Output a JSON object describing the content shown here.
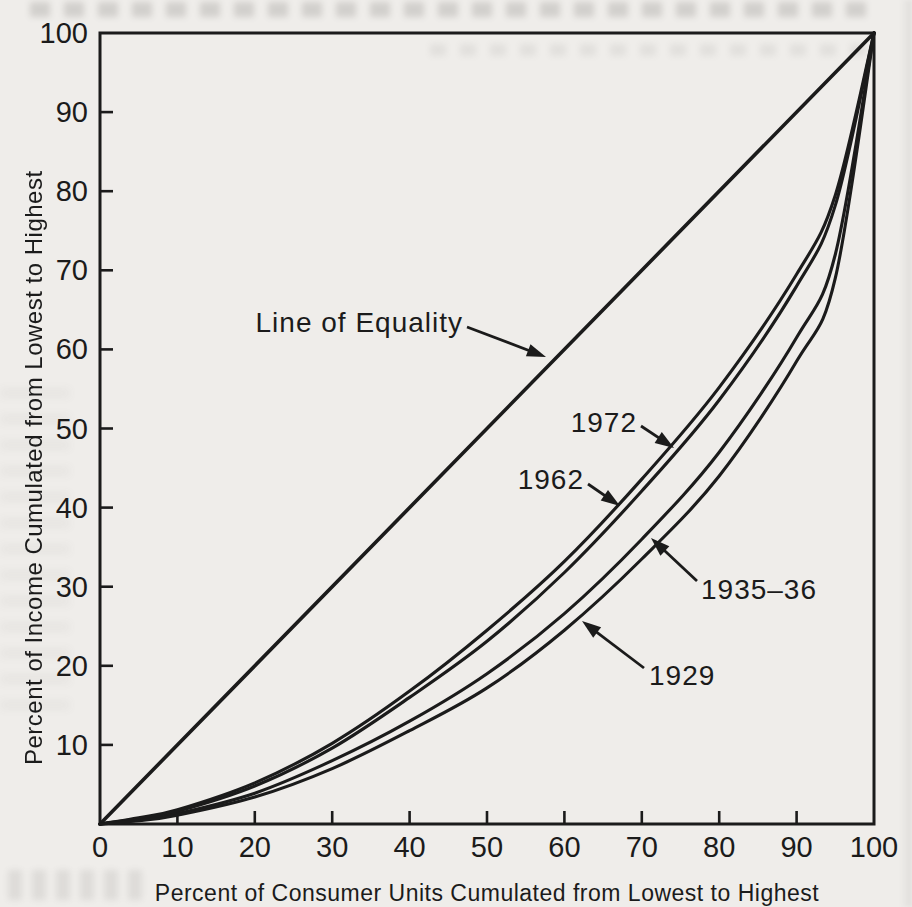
{
  "style": {
    "background": "#efedea",
    "ink": "#1b1b1b"
  },
  "chart_data": {
    "type": "line",
    "title": "",
    "xlabel": "Percent of Consumer Units Cumulated from Lowest to Highest",
    "ylabel": "Percent of Income Cumulated from Lowest to Highest",
    "xlim": [
      0,
      100
    ],
    "ylim": [
      0,
      100
    ],
    "x_ticks": [
      0,
      10,
      20,
      30,
      40,
      50,
      60,
      70,
      80,
      90,
      100
    ],
    "y_ticks": [
      10,
      20,
      30,
      40,
      50,
      60,
      70,
      80,
      90,
      100
    ],
    "grid": false,
    "legend": "arrow-annotated-labels",
    "series": [
      {
        "name": "Line of Equality",
        "points": [
          [
            0,
            0
          ],
          [
            100,
            100
          ]
        ]
      },
      {
        "name": "1972",
        "points": [
          [
            0,
            0
          ],
          [
            5,
            0.8
          ],
          [
            10,
            1.8
          ],
          [
            20,
            5.2
          ],
          [
            30,
            10.2
          ],
          [
            40,
            16.8
          ],
          [
            50,
            24.5
          ],
          [
            60,
            33.2
          ],
          [
            70,
            43.6
          ],
          [
            80,
            55.2
          ],
          [
            90,
            69.5
          ],
          [
            95,
            79.5
          ],
          [
            100,
            100
          ]
        ]
      },
      {
        "name": "1962",
        "points": [
          [
            0,
            0
          ],
          [
            5,
            0.7
          ],
          [
            10,
            1.6
          ],
          [
            20,
            4.8
          ],
          [
            30,
            9.6
          ],
          [
            40,
            16.0
          ],
          [
            50,
            23.1
          ],
          [
            60,
            31.8
          ],
          [
            70,
            42.1
          ],
          [
            80,
            53.6
          ],
          [
            90,
            68.0
          ],
          [
            95,
            78.2
          ],
          [
            100,
            100
          ]
        ]
      },
      {
        "name": "1935-36",
        "points": [
          [
            0,
            0
          ],
          [
            5,
            0.5
          ],
          [
            10,
            1.3
          ],
          [
            20,
            3.9
          ],
          [
            30,
            8.0
          ],
          [
            40,
            13.0
          ],
          [
            50,
            19.0
          ],
          [
            60,
            26.6
          ],
          [
            70,
            36.0
          ],
          [
            80,
            47.0
          ],
          [
            90,
            61.5
          ],
          [
            95,
            72.0
          ],
          [
            100,
            100
          ]
        ]
      },
      {
        "name": "1929",
        "points": [
          [
            0,
            0
          ],
          [
            5,
            0.4
          ],
          [
            10,
            1.1
          ],
          [
            20,
            3.4
          ],
          [
            30,
            7.0
          ],
          [
            40,
            11.8
          ],
          [
            50,
            17.2
          ],
          [
            60,
            24.5
          ],
          [
            70,
            33.5
          ],
          [
            80,
            44.0
          ],
          [
            90,
            58.5
          ],
          [
            95,
            69.0
          ],
          [
            100,
            100
          ]
        ]
      }
    ],
    "annotations": [
      {
        "text": "Line of Equality",
        "anchor": "end",
        "text_px": [
          463,
          322
        ],
        "arrow_from_px": [
          467,
          327
        ],
        "arrow_to_px": [
          546,
          357
        ]
      },
      {
        "text": "1972",
        "anchor": "end",
        "text_px": [
          637,
          422
        ],
        "arrow_from_px": [
          641,
          426
        ],
        "arrow_to_px": [
          674,
          448
        ]
      },
      {
        "text": "1962",
        "anchor": "end",
        "text_px": [
          584,
          479
        ],
        "arrow_from_px": [
          588,
          484
        ],
        "arrow_to_px": [
          620,
          506
        ]
      },
      {
        "text": "1935–36",
        "anchor": "start",
        "text_px": [
          701,
          589
        ],
        "arrow_from_px": [
          697,
          581
        ],
        "arrow_to_px": [
          651,
          538
        ]
      },
      {
        "text": "1929",
        "anchor": "start",
        "text_px": [
          649,
          675
        ],
        "arrow_from_px": [
          644,
          668
        ],
        "arrow_to_px": [
          582,
          621
        ]
      }
    ]
  }
}
